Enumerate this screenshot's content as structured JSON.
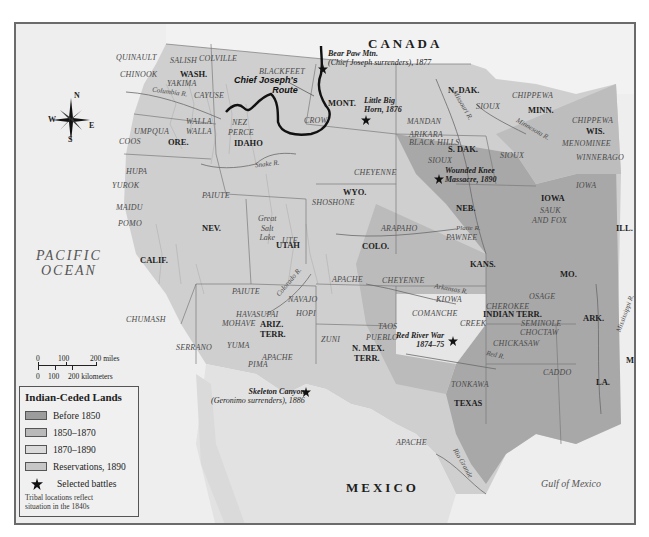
{
  "map": {
    "countries": {
      "canada": "CANADA",
      "mexico": "MEXICO"
    },
    "water": {
      "ocean_line1": "PACIFIC",
      "ocean_line2": "OCEAN",
      "gulf": "Gulf of Mexico"
    },
    "compass": {
      "n": "N",
      "s": "S",
      "e": "E",
      "w": "W"
    },
    "states": {
      "wash": "WASH.",
      "ore": "ORE.",
      "idaho": "IDAHO",
      "mont": "MONT.",
      "wyo": "WYO.",
      "ndak": "N. DAK.",
      "sdak": "S. DAK.",
      "minn": "MINN.",
      "wis": "WIS.",
      "iowa": "IOWA",
      "neb": "NEB.",
      "ill": "ILL.",
      "nev": "NEV.",
      "utah": "UTAH",
      "colo": "COLO.",
      "kans": "KANS.",
      "mo": "MO.",
      "calif": "CALIF.",
      "ariz1": "ARIZ.",
      "ariz2": "TERR.",
      "nmex1": "N. MEX.",
      "nmex2": "TERR.",
      "indian": "INDIAN TERR.",
      "ark": "ARK.",
      "miss": "MISS.",
      "la": "LA.",
      "texas": "TEXAS"
    },
    "tribes": {
      "quinault": "QUINAULT",
      "salish": "SALISH",
      "colville": "COLVILLE",
      "chinook": "CHINOOK",
      "yakima": "YAKIMA",
      "cayuse": "CAYUSE",
      "blackfeet": "BLACKFEET",
      "walla1": "WALLA",
      "walla2": "WALLA",
      "umpqua": "UMPQUA",
      "coos": "COOS",
      "nez1": "NEZ",
      "nez2": "PERCE",
      "crow": "CROW",
      "mandan": "MANDAN",
      "arikara": "ARIKARA",
      "sioux1": "SIOUX",
      "sioux2": "SIOUX",
      "sioux3": "SIOUX",
      "chippewa1": "CHIPPEWA",
      "chippewa2": "CHIPPEWA",
      "menominee": "MENOMINEE",
      "winnebago": "WINNEBAGO",
      "hula": "HUPA",
      "yurok": "YUROK",
      "maidu": "MAIDU",
      "pomo": "POMO",
      "paiute1": "PAIUTE",
      "paiute2": "PAIUTE",
      "shoshone": "SHOSHONE",
      "cheyenne1": "CHEYENNE",
      "cheyenne2": "CHEYENNE",
      "ute": "UTE",
      "arapaho": "ARAPAHO",
      "pawnee": "PAWNEE",
      "sauk1": "SAUK",
      "sauk2": "AND FOX",
      "iowa_t": "IOWA",
      "apache1": "APACHE",
      "apache2": "APACHE",
      "apache3": "APACHE",
      "navajo": "NAVAJO",
      "hopi": "HOPI",
      "havasupai": "HAVASUPAI",
      "mohave": "MOHAVE",
      "yuma": "YUMA",
      "pima": "PIMA",
      "zuni": "ZUNI",
      "taos": "TAOS",
      "pueblo": "PUEBLO",
      "kiowa": "KIOWA",
      "comanche": "COMANCHE",
      "osage": "OSAGE",
      "cherokee": "CHEROKEE",
      "creek": "CREEK",
      "seminole": "SEMINOLE",
      "choctaw": "CHOCTAW",
      "chickasaw": "CHICKASAW",
      "chumash": "CHUMASH",
      "serrano": "SERRANO",
      "caddo": "CADDO",
      "tonkawa": "TONKAWA"
    },
    "features": {
      "black_hills": "BLACK HILLS",
      "great_salt_lake1": "Great",
      "great_salt_lake2": "Salt",
      "great_salt_lake3": "Lake"
    },
    "rivers": {
      "columbia": "Columbia R.",
      "snake": "Snake R.",
      "missouri": "Missouri R.",
      "minnesota": "Minnesota R.",
      "platte": "Platte R.",
      "arkansas": "Arkansas R.",
      "colorado": "Colorado R.",
      "red": "Red R.",
      "rio_grande": "Rio Grande",
      "mississippi": "Mississippi R."
    },
    "battles": [
      {
        "line1": "Bear Paw Mtn.",
        "line2": "(Chief Joseph surrenders), 1877"
      },
      {
        "line1": "Little Big",
        "line2": "Horn, 1876"
      },
      {
        "line1": "Wounded Knee",
        "line2": "Massacre, 1890"
      },
      {
        "line1": "Red River War",
        "line2": "1874–75"
      },
      {
        "line1": "Skeleton Canyon",
        "line2": "(Geronimo surrenders), 1886"
      }
    ],
    "route": {
      "line1": "Chief Joseph's",
      "line2": "Route"
    },
    "scale": {
      "miles": [
        "0",
        "100",
        "200 miles"
      ],
      "km": [
        "0",
        "100",
        "200 kilometers"
      ]
    }
  },
  "legend": {
    "title": "Indian-Ceded Lands",
    "items": [
      {
        "label": "Before 1850",
        "color": "#9c9c9c"
      },
      {
        "label": "1850–1870",
        "color": "#b9b9b9"
      },
      {
        "label": "1870–1890",
        "color": "#dadada"
      },
      {
        "label": "Reservations, 1890",
        "color": "#c6c6c6"
      }
    ],
    "battles_label": "Selected battles",
    "note_line1": "Tribal locations reflect",
    "note_line2": "situation in the 1840s"
  }
}
